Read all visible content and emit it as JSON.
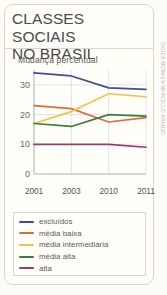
{
  "header": {
    "title": "CLASSES SOCIAIS\nNO BRASIL"
  },
  "chart_subtitle": "Mudança percentual",
  "credit": {
    "text": "DIDIER MORAES/MARCELLO ARAUJO"
  },
  "legend": {
    "position": "below-chart",
    "items": [
      {
        "label": "excluídos",
        "color": "#3f4d95"
      },
      {
        "label": "média baixa",
        "color": "#e06b35"
      },
      {
        "label": "média intermediária",
        "color": "#f2c14b"
      },
      {
        "label": "média alta",
        "color": "#3f7a45"
      },
      {
        "label": "alta",
        "color": "#9c3a6b"
      }
    ]
  },
  "axes": {
    "y_ticks": [
      "30",
      "20",
      "10",
      "0"
    ],
    "x_ticks": [
      "2001",
      "2003",
      "2010",
      "2011"
    ]
  },
  "chart_data": {
    "type": "line",
    "title": "CLASSES SOCIAIS NO BRASIL",
    "subtitle": "Mudança percentual",
    "xlabel": "",
    "ylabel": "",
    "categories": [
      "2001",
      "2003",
      "2010",
      "2011"
    ],
    "ylim": [
      0,
      35
    ],
    "xlim": [
      0,
      3
    ],
    "yticks": [
      0,
      10,
      20,
      30
    ],
    "grid": true,
    "legend_position": "bottom",
    "series": [
      {
        "name": "excluídos",
        "color": "#3f4d95",
        "values": [
          34,
          33,
          29,
          28.5
        ]
      },
      {
        "name": "média baixa",
        "color": "#e06b35",
        "values": [
          23,
          22,
          17.5,
          19
        ]
      },
      {
        "name": "média intermediária",
        "color": "#f2c14b",
        "values": [
          17,
          21,
          27,
          26
        ]
      },
      {
        "name": "média alta",
        "color": "#3f7a45",
        "values": [
          17,
          16,
          20,
          19.5
        ]
      },
      {
        "name": "alta",
        "color": "#9c3a6b",
        "values": [
          10,
          10,
          10,
          9
        ]
      }
    ]
  }
}
